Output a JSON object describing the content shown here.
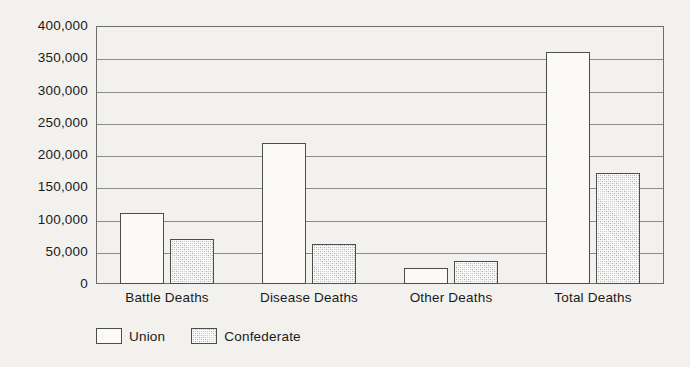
{
  "chart_data": {
    "type": "bar",
    "title": "",
    "subtitle": "",
    "xlabel": "",
    "ylabel": "",
    "categories": [
      "Battle Deaths",
      "Disease Deaths",
      "Other Deaths",
      "Total Deaths"
    ],
    "series": [
      {
        "name": "Union",
        "values": [
          110000,
          219000,
          25000,
          360000
        ]
      },
      {
        "name": "Confederate",
        "values": [
          70000,
          62000,
          36000,
          172000
        ]
      }
    ],
    "legend": [
      "Union",
      "Confederate"
    ],
    "legend_position": "bottom-left",
    "ylim": [
      0,
      400000
    ],
    "ytick_values": [
      400000,
      350000,
      300000,
      250000,
      200000,
      150000,
      100000,
      50000,
      0
    ],
    "ytick_labels": [
      "400,000",
      "350,000",
      "300,000",
      "250,000",
      "200,000",
      "150,000",
      "100,000",
      "50,000",
      "0"
    ],
    "grid": true,
    "grid_axis": "y",
    "colors": {
      "background": "#f2f1ee",
      "union_fill": "#fbfaf7",
      "confederate_fill": "#d2d2d2",
      "bar_outline": "#4d4d4d",
      "gridline": "#8a8a8a",
      "frame": "#6d6d6d",
      "text": "#1a1a1a"
    }
  }
}
